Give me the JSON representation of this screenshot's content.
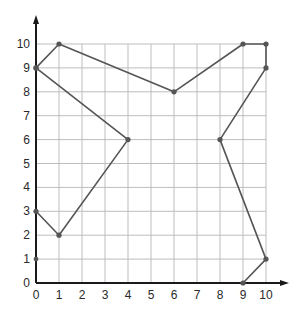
{
  "chart_data": {
    "type": "line",
    "title": "",
    "xlabel": "",
    "ylabel": "",
    "xlim": [
      0,
      10
    ],
    "ylim": [
      0,
      10
    ],
    "grid": true,
    "x_ticks": [
      "0",
      "1",
      "2",
      "3",
      "4",
      "5",
      "6",
      "7",
      "8",
      "9",
      "10"
    ],
    "y_ticks": [
      "0",
      "1",
      "2",
      "3",
      "4",
      "5",
      "6",
      "7",
      "8",
      "9",
      "10"
    ],
    "series": [
      {
        "name": "outline-a",
        "points": [
          [
            0,
            9
          ],
          [
            1,
            10
          ],
          [
            6,
            8
          ],
          [
            9,
            10
          ],
          [
            10,
            10
          ],
          [
            10,
            9
          ],
          [
            8,
            6
          ],
          [
            10,
            1
          ],
          [
            9,
            0
          ]
        ]
      },
      {
        "name": "outline-b",
        "points": [
          [
            0,
            9
          ],
          [
            4,
            6
          ],
          [
            1,
            2
          ],
          [
            0,
            3
          ]
        ]
      }
    ],
    "isolated_points": [
      [
        0,
        1
      ]
    ]
  },
  "colors": {
    "line": "#555555",
    "grid": "#bdbdbd",
    "axis": "#1a1a1a"
  }
}
